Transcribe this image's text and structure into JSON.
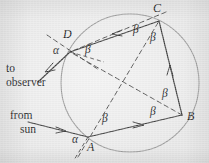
{
  "figure": {
    "background_color": "#ececec",
    "ink_color": "#3a3a3a",
    "circle": {
      "name": "raindrop-circle",
      "cx": 130,
      "cy": 83,
      "r": 69,
      "stroke": "#8d8d8d"
    },
    "vertices": [
      {
        "id": "A",
        "label": "A",
        "x": 88,
        "y": 137,
        "label_x": 88,
        "label_y": 144
      },
      {
        "id": "B",
        "label": "B",
        "x": 182,
        "y": 115,
        "label_x": 189,
        "label_y": 115
      },
      {
        "id": "C",
        "label": "C",
        "x": 159,
        "y": 21,
        "label_x": 158,
        "label_y": 6
      },
      {
        "id": "D",
        "label": "D",
        "x": 70,
        "y": 52,
        "label_x": 67,
        "label_y": 33
      }
    ],
    "angle_labels": [
      {
        "name": "alpha-at-D",
        "text": "α",
        "x": 56,
        "y": 50
      },
      {
        "name": "alpha-at-A",
        "text": "α",
        "x": 74,
        "y": 138
      },
      {
        "name": "beta-at-D",
        "text": "β",
        "x": 88,
        "y": 49
      },
      {
        "name": "beta-at-C-left",
        "text": "β",
        "x": 135,
        "y": 29
      },
      {
        "name": "beta-at-C-right",
        "text": "β",
        "x": 152,
        "y": 36
      },
      {
        "name": "beta-at-B-upper",
        "text": "β",
        "x": 164,
        "y": 92
      },
      {
        "name": "beta-at-B-lower",
        "text": "β",
        "x": 152,
        "y": 110
      },
      {
        "name": "beta-at-A",
        "text": "β",
        "x": 104,
        "y": 117
      }
    ],
    "text_labels": [
      {
        "name": "to-observer-label",
        "line1": "to",
        "line2": "observer",
        "x": 6,
        "y": 64
      },
      {
        "name": "from-sun-label",
        "line1": "from",
        "line2": "sun",
        "x": 12,
        "y": 112
      }
    ],
    "rays": {
      "incoming_sun": {
        "name": "incident-sun-ray",
        "from_x": 28,
        "from_y": 122,
        "to_x": 88,
        "to_y": 137
      },
      "outgoing_observer": {
        "name": "refracted-observer-ray",
        "from_x": 70,
        "from_y": 52,
        "to_x": 38,
        "to_y": 82
      }
    },
    "chords": [
      {
        "name": "chord-A-B",
        "from": "A",
        "to": "B",
        "style": "solid"
      },
      {
        "name": "chord-B-C",
        "from": "B",
        "to": "C",
        "style": "solid"
      },
      {
        "name": "chord-C-D",
        "from": "C",
        "to": "D",
        "style": "solid"
      }
    ],
    "radii": [
      {
        "name": "radius-center-A",
        "style": "dashed"
      },
      {
        "name": "radius-center-B",
        "style": "dashed"
      },
      {
        "name": "radius-center-C",
        "style": "dashed"
      },
      {
        "name": "radius-center-D",
        "style": "dashed"
      }
    ]
  }
}
